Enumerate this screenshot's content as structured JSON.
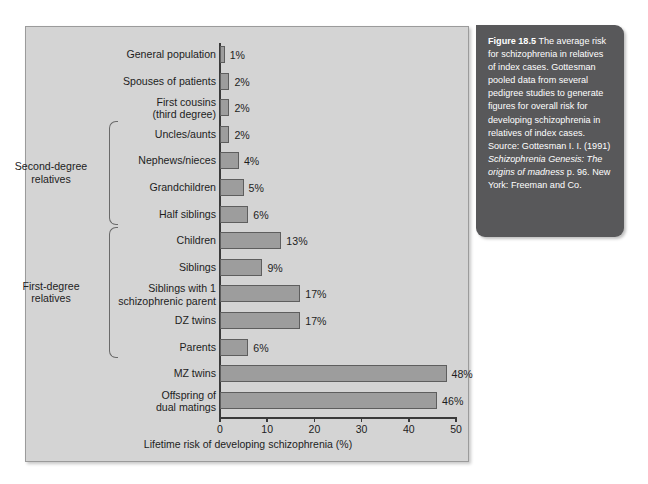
{
  "figure": {
    "caption_label": "Figure 18.5",
    "caption_body": " The average risk for schizophrenia in relatives of index cases. Gottesman pooled data from several pedigree studies to generate figures for overall risk for developing schizophrenia in relatives of index cases. ",
    "source_prefix": "Source: Gottesman I. I. (1991) ",
    "source_italic": "Schizophrenia Genesis: The origins of madness",
    "source_suffix": " p. 96. New York: Freeman and Co.",
    "panel_color": "#d4d4d4",
    "bar_color": "#9d9d9d",
    "bar_edge_color": "#5e5e5e",
    "caption_bg": "#58585a"
  },
  "groups": [
    {
      "label": "Second-degree\nrelatives",
      "first": 3,
      "last": 6
    },
    {
      "label": "First-degree\nrelatives",
      "first": 7,
      "last": 11
    }
  ],
  "chart_data": {
    "type": "bar",
    "orientation": "horizontal",
    "title": "",
    "xlabel": "Lifetime risk of developing schizophrenia (%)",
    "ylabel": "",
    "xlim": [
      0,
      50
    ],
    "xticks": [
      0,
      10,
      20,
      30,
      40,
      50
    ],
    "xtick_labels": [
      "0",
      "10",
      "20",
      "30",
      "40",
      "50"
    ],
    "grid": false,
    "legend": "none",
    "categories": [
      "General population",
      "Spouses of patients",
      "First cousins\n(third degree)",
      "Uncles/aunts",
      "Nephews/nieces",
      "Grandchildren",
      "Half siblings",
      "Children",
      "Siblings",
      "Siblings with 1\nschizophrenic parent",
      "DZ twins",
      "Parents",
      "MZ twins",
      "Offspring of\ndual matings"
    ],
    "values": [
      1,
      2,
      2,
      2,
      4,
      5,
      6,
      13,
      9,
      17,
      17,
      6,
      48,
      46
    ],
    "value_labels": [
      "1%",
      "2%",
      "2%",
      "2%",
      "4%",
      "5%",
      "6%",
      "13%",
      "9%",
      "17%",
      "17%",
      "6%",
      "48%",
      "46%"
    ]
  }
}
